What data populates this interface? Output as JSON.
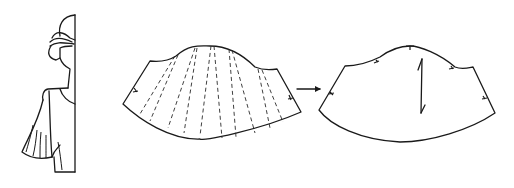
{
  "diagram": {
    "type": "sewing-pattern-illustration",
    "panels": [
      {
        "id": "figure",
        "label": "Figure wearing flared sleeve"
      },
      {
        "id": "slashed-sleeve",
        "label": "Sleeve pattern with slash lines",
        "slash_lines": 12,
        "notches": 2
      },
      {
        "id": "arrow",
        "label": "Transformation arrow"
      },
      {
        "id": "final-sleeve",
        "label": "Final flared sleeve pattern",
        "notches": 5,
        "grainline": true
      }
    ],
    "colors": {
      "line": "#1a1a1a",
      "background": "#ffffff"
    }
  }
}
